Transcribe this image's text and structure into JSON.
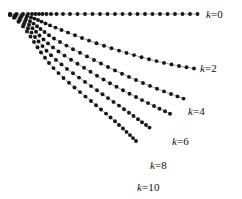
{
  "figure": {
    "background_color": "#ffffff",
    "dot_color": "#161616",
    "line_color": "#7a7a7a",
    "label_color": "#111111",
    "width": 242,
    "height": 199
  },
  "chart_data": {
    "type": "scatter",
    "title": "",
    "xlabel": "",
    "ylabel": "",
    "xlim": [
      0,
      242
    ],
    "ylim": [
      199,
      0
    ],
    "grid": false,
    "legend_position": "right-inline-end-of-curve",
    "marker": "filled-circle",
    "connected": true,
    "series": [
      {
        "name": "k=0",
        "label_var": "k",
        "label_eq": "=0",
        "label_x": 206,
        "label_y": 9,
        "points": [
          [
            10.0,
            14.0
          ],
          [
            16.5,
            14.0
          ],
          [
            23.0,
            14.0
          ],
          [
            28.0,
            14.0
          ],
          [
            32.0,
            14.0
          ],
          [
            35.5,
            14.0
          ],
          [
            39.0,
            14.0
          ],
          [
            42.5,
            14.0
          ],
          [
            46.5,
            14.0
          ],
          [
            51.0,
            14.0
          ],
          [
            56.5,
            14.0
          ],
          [
            63.0,
            14.0
          ],
          [
            70.0,
            14.0
          ],
          [
            77.5,
            14.0
          ],
          [
            85.0,
            14.0
          ],
          [
            92.5,
            14.0
          ],
          [
            100.0,
            14.0
          ],
          [
            107.5,
            14.0
          ],
          [
            115.0,
            14.0
          ],
          [
            122.5,
            14.0
          ],
          [
            130.0,
            14.0
          ],
          [
            137.5,
            14.0
          ],
          [
            145.0,
            14.0
          ],
          [
            152.5,
            14.0
          ],
          [
            160.0,
            14.0
          ],
          [
            167.5,
            14.0
          ],
          [
            175.0,
            14.0
          ],
          [
            182.5,
            14.0
          ],
          [
            190.0,
            14.0
          ],
          [
            197.5,
            14.0
          ]
        ]
      },
      {
        "name": "k=2",
        "label_var": "k",
        "label_eq": "=2",
        "label_x": 200,
        "label_y": 63,
        "points": [
          [
            10.0,
            14.2
          ],
          [
            16.0,
            14.6
          ],
          [
            22.0,
            15.3
          ],
          [
            27.0,
            16.3
          ],
          [
            31.0,
            17.4
          ],
          [
            34.5,
            18.6
          ],
          [
            38.0,
            20.0
          ],
          [
            41.5,
            21.6
          ],
          [
            45.5,
            23.4
          ],
          [
            50.0,
            25.4
          ],
          [
            55.5,
            27.6
          ],
          [
            61.5,
            30.0
          ],
          [
            68.0,
            32.6
          ],
          [
            75.0,
            35.3
          ],
          [
            82.0,
            38.0
          ],
          [
            89.0,
            40.6
          ],
          [
            96.5,
            43.2
          ],
          [
            104.0,
            45.7
          ],
          [
            111.5,
            48.2
          ],
          [
            119.0,
            50.6
          ],
          [
            126.5,
            52.9
          ],
          [
            134.0,
            55.1
          ],
          [
            141.5,
            57.2
          ],
          [
            149.0,
            59.2
          ],
          [
            156.5,
            61.1
          ],
          [
            164.0,
            62.9
          ],
          [
            171.5,
            64.5
          ],
          [
            179.0,
            66.0
          ],
          [
            186.5,
            67.3
          ],
          [
            194.0,
            68.4
          ]
        ]
      },
      {
        "name": "k=4",
        "label_var": "k",
        "label_eq": "=4",
        "label_x": 188,
        "label_y": 106,
        "points": [
          [
            10.0,
            14.4
          ],
          [
            15.5,
            15.4
          ],
          [
            21.0,
            17.0
          ],
          [
            26.0,
            19.0
          ],
          [
            30.0,
            21.2
          ],
          [
            33.5,
            23.6
          ],
          [
            37.0,
            26.2
          ],
          [
            40.5,
            29.0
          ],
          [
            44.5,
            32.0
          ],
          [
            49.0,
            35.2
          ],
          [
            54.0,
            38.5
          ],
          [
            60.0,
            42.0
          ],
          [
            66.5,
            45.6
          ],
          [
            73.0,
            49.2
          ],
          [
            80.0,
            52.8
          ],
          [
            87.0,
            56.4
          ],
          [
            94.0,
            60.0
          ],
          [
            101.0,
            63.5
          ],
          [
            108.0,
            67.0
          ],
          [
            115.0,
            70.4
          ],
          [
            122.0,
            73.7
          ],
          [
            129.0,
            76.9
          ],
          [
            136.0,
            80.0
          ],
          [
            143.0,
            83.0
          ],
          [
            150.0,
            85.9
          ],
          [
            157.0,
            88.7
          ],
          [
            164.0,
            91.4
          ],
          [
            171.0,
            94.0
          ],
          [
            177.5,
            96.4
          ],
          [
            183.5,
            98.6
          ]
        ]
      },
      {
        "name": "k=6",
        "label_var": "k",
        "label_eq": "=6",
        "label_x": 172,
        "label_y": 136,
        "points": [
          [
            10.0,
            14.6
          ],
          [
            15.0,
            16.2
          ],
          [
            20.0,
            18.6
          ],
          [
            25.0,
            21.6
          ],
          [
            29.0,
            24.8
          ],
          [
            32.5,
            28.2
          ],
          [
            36.0,
            31.8
          ],
          [
            39.5,
            35.5
          ],
          [
            43.5,
            39.4
          ],
          [
            48.0,
            43.4
          ],
          [
            53.0,
            47.4
          ],
          [
            58.5,
            51.5
          ],
          [
            64.5,
            55.6
          ],
          [
            71.0,
            59.7
          ],
          [
            77.5,
            63.8
          ],
          [
            84.0,
            67.8
          ],
          [
            90.5,
            71.8
          ],
          [
            97.0,
            75.7
          ],
          [
            103.5,
            79.5
          ],
          [
            110.0,
            83.2
          ],
          [
            116.5,
            86.8
          ],
          [
            123.0,
            90.3
          ],
          [
            129.5,
            93.7
          ],
          [
            136.0,
            97.0
          ],
          [
            142.0,
            100.1
          ],
          [
            148.0,
            103.1
          ],
          [
            154.0,
            106.0
          ],
          [
            159.5,
            108.7
          ],
          [
            165.0,
            111.3
          ],
          [
            170.0,
            113.7
          ]
        ]
      },
      {
        "name": "k=8",
        "label_var": "k",
        "label_eq": "=8",
        "label_x": 150,
        "label_y": 160,
        "points": [
          [
            10.0,
            14.8
          ],
          [
            14.5,
            17.0
          ],
          [
            19.5,
            20.2
          ],
          [
            24.0,
            24.0
          ],
          [
            28.0,
            28.2
          ],
          [
            31.5,
            32.6
          ],
          [
            35.0,
            37.0
          ],
          [
            38.5,
            41.5
          ],
          [
            42.5,
            46.1
          ],
          [
            46.5,
            50.7
          ],
          [
            51.0,
            55.3
          ],
          [
            56.0,
            59.9
          ],
          [
            61.5,
            64.4
          ],
          [
            67.0,
            68.9
          ],
          [
            73.0,
            73.3
          ],
          [
            79.0,
            77.6
          ],
          [
            85.0,
            81.9
          ],
          [
            91.0,
            86.1
          ],
          [
            97.0,
            90.2
          ],
          [
            102.5,
            94.2
          ],
          [
            108.0,
            98.1
          ],
          [
            113.5,
            101.9
          ],
          [
            119.0,
            105.6
          ],
          [
            124.0,
            109.2
          ],
          [
            129.0,
            112.7
          ],
          [
            133.5,
            116.0
          ],
          [
            138.0,
            119.2
          ],
          [
            142.0,
            122.2
          ],
          [
            146.0,
            125.0
          ],
          [
            149.5,
            127.6
          ]
        ]
      },
      {
        "name": "k=10",
        "label_var": "k",
        "label_eq": "=10",
        "label_x": 137,
        "label_y": 182,
        "points": [
          [
            10.0,
            15.0
          ],
          [
            14.0,
            17.8
          ],
          [
            18.5,
            21.8
          ],
          [
            23.0,
            26.4
          ],
          [
            27.0,
            31.4
          ],
          [
            30.5,
            36.6
          ],
          [
            34.0,
            41.9
          ],
          [
            37.5,
            47.2
          ],
          [
            41.0,
            52.5
          ],
          [
            45.0,
            57.8
          ],
          [
            49.0,
            63.0
          ],
          [
            53.5,
            68.1
          ],
          [
            58.5,
            73.1
          ],
          [
            63.5,
            78.0
          ],
          [
            69.0,
            82.8
          ],
          [
            74.5,
            87.5
          ],
          [
            80.0,
            92.1
          ],
          [
            85.5,
            96.6
          ],
          [
            91.0,
            101.0
          ],
          [
            96.0,
            105.3
          ],
          [
            101.0,
            109.5
          ],
          [
            106.0,
            113.6
          ],
          [
            110.5,
            117.5
          ],
          [
            115.0,
            121.3
          ],
          [
            119.0,
            125.0
          ],
          [
            123.0,
            128.5
          ],
          [
            126.5,
            131.9
          ],
          [
            130.0,
            135.1
          ],
          [
            133.0,
            138.1
          ],
          [
            136.0,
            141.0
          ]
        ]
      }
    ]
  }
}
